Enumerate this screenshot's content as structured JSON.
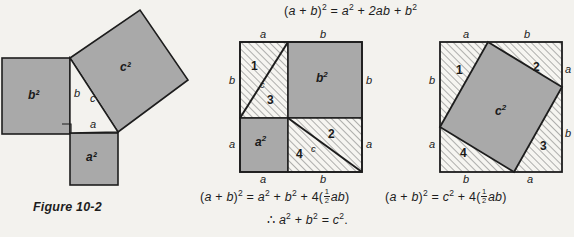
{
  "page": {
    "background": "#f3f2ee",
    "fill_gray": "#a9a9a9",
    "stroke": "#1d1d1d",
    "hatch_color": "#6f6f6f"
  },
  "equations": {
    "top": {
      "id": "expansion",
      "text": "(a + b)² = a² + 2ab + b²",
      "parts": [
        "(",
        "a",
        "+",
        "b",
        ")",
        "2",
        "=",
        "a",
        "2",
        "+",
        "2ab",
        "+",
        "b",
        "2"
      ]
    },
    "middle_bottom": {
      "id": "middle-identity",
      "text": "(a + b)² = a² + b² + 4(½ab)",
      "lead": "(",
      "var1": "a",
      "plus1": "+",
      "var2": "b",
      "close": ")",
      "exp": "2",
      "eq": "=",
      "term1": "a",
      "term1exp": "2",
      "plus2": "+",
      "term2": "b",
      "term2exp": "2",
      "plus3": "+",
      "four": "4(",
      "frac_num": "1",
      "frac_den": "2",
      "ab": "ab",
      "endparen": ")"
    },
    "right_bottom": {
      "id": "right-identity",
      "text": "(a + b)² = c² + 4(½ab)",
      "lead": "(",
      "var1": "a",
      "plus1": "+",
      "var2": "b",
      "close": ")",
      "exp": "2",
      "eq": "=",
      "term1": "c",
      "term1exp": "2",
      "plus3": "+",
      "four": "4(",
      "frac_num": "1",
      "frac_den": "2",
      "ab": "ab",
      "endparen": ")"
    },
    "conclusion": {
      "id": "pythagorean-conclusion",
      "text": "∴ a² + b² = c².",
      "therefore": "∴",
      "term1": "a",
      "term1exp": "2",
      "plus": "+",
      "term2": "b",
      "term2exp": "2",
      "eq": "=",
      "term3": "c",
      "term3exp": "2",
      "period": "."
    }
  },
  "figure_caption": "Figure 10-2",
  "diagram_left": {
    "name": "pythagorean-squares-figure",
    "squares": [
      {
        "label": "b²",
        "base": "b",
        "exp": "2"
      },
      {
        "label": "a²",
        "base": "a",
        "exp": "2"
      },
      {
        "label": "c²",
        "base": "c",
        "exp": "2"
      }
    ],
    "side_labels": [
      {
        "name": "leg-b-label",
        "text": "b"
      },
      {
        "name": "leg-a-label",
        "text": "a"
      },
      {
        "name": "hypotenuse-c-label",
        "text": "c"
      }
    ],
    "right_angle_marker": true
  },
  "diagram_middle": {
    "name": "square-decomposition-a2-b2",
    "region_labels": [
      {
        "name": "region-1",
        "text": "1"
      },
      {
        "name": "region-2",
        "text": "2"
      },
      {
        "name": "region-3",
        "text": "3"
      },
      {
        "name": "region-4",
        "text": "4"
      }
    ],
    "area_labels": [
      {
        "name": "area-b2",
        "base": "b",
        "exp": "2"
      },
      {
        "name": "area-a2",
        "base": "a",
        "exp": "2"
      }
    ],
    "hyp_labels": [
      {
        "name": "hyp-c-upper",
        "text": "c"
      },
      {
        "name": "hyp-c-lower",
        "text": "c"
      }
    ],
    "edge_labels": {
      "top_left": "a",
      "top_right": "b",
      "right_top": "b",
      "right_bottom": "a",
      "bottom_left": "a",
      "bottom_right": "b",
      "left_top": "b",
      "left_bottom": "a"
    }
  },
  "diagram_right": {
    "name": "square-decomposition-c2",
    "region_labels": [
      {
        "name": "region-1",
        "text": "1"
      },
      {
        "name": "region-2",
        "text": "2"
      },
      {
        "name": "region-3",
        "text": "3"
      },
      {
        "name": "region-4",
        "text": "4"
      }
    ],
    "area_label": {
      "name": "area-c2",
      "base": "c",
      "exp": "2"
    },
    "edge_labels": {
      "top_left": "a",
      "top_right": "b",
      "right_top": "a",
      "right_bottom": "b",
      "bottom_left": "b",
      "bottom_right": "a",
      "left_top": "b",
      "left_bottom": "a"
    }
  }
}
